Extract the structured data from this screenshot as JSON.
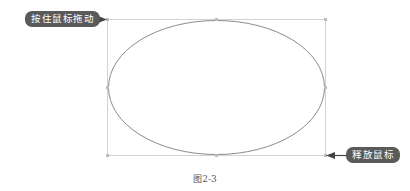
{
  "figure": {
    "caption": "图2-3",
    "start_label": "按住鼠标拖动",
    "end_label": "释放鼠标"
  },
  "shapes": {
    "bounding_box": {
      "x": 107,
      "y": 19,
      "width": 218,
      "height": 136,
      "color": "#cfcfcf"
    },
    "ellipse": {
      "cx": 216,
      "cy": 87,
      "rx": 108,
      "ry": 67,
      "color": "#8a8a8a"
    }
  },
  "colors": {
    "pill_bg": "#5a5a5a",
    "arrow": "#444444"
  }
}
